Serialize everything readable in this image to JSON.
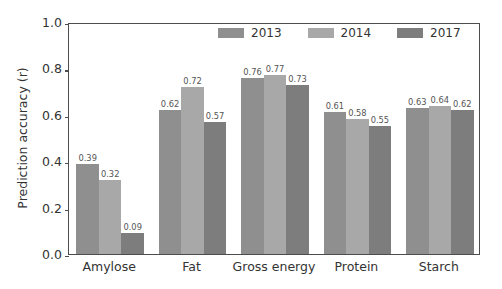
{
  "chart_data": {
    "type": "bar",
    "title": "",
    "xlabel": "",
    "ylabel": "Prediction accuracy (r)",
    "categories": [
      "Amylose",
      "Fat",
      "Gross energy",
      "Protein",
      "Starch"
    ],
    "series": [
      {
        "name": "2013",
        "values": [
          0.39,
          0.62,
          0.76,
          0.61,
          0.63
        ],
        "color": "#8f8f8f"
      },
      {
        "name": "2014",
        "values": [
          0.32,
          0.72,
          0.77,
          0.58,
          0.64
        ],
        "color": "#a8a8a8"
      },
      {
        "name": "2017",
        "values": [
          0.09,
          0.57,
          0.73,
          0.55,
          0.62
        ],
        "color": "#7d7d7d"
      }
    ],
    "value_labels": [
      [
        "0.39",
        "0.32",
        "0.09"
      ],
      [
        "0.62",
        "0.72",
        "0.57"
      ],
      [
        "0.76",
        "0.77",
        "0.73"
      ],
      [
        "0.61",
        "0.58",
        "0.55"
      ],
      [
        "0.63",
        "0.64",
        "0.62"
      ]
    ],
    "ylim": [
      0.0,
      1.0
    ],
    "yticks": [
      "0.0",
      "0.2",
      "0.4",
      "0.6",
      "0.8",
      "1.0"
    ],
    "ytick_values": [
      0.0,
      0.2,
      0.4,
      0.6,
      0.8,
      1.0
    ],
    "grid": false,
    "legend_position": "top-right-inside",
    "axis_color": "#4d4d4d",
    "background_color": "#ffffff"
  }
}
